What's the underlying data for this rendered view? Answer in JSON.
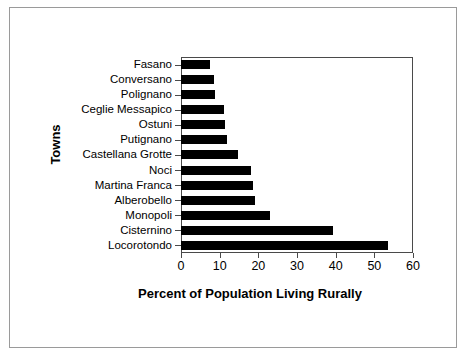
{
  "chart_data": {
    "type": "bar",
    "orientation": "horizontal",
    "title": "",
    "xlabel": "Percent of Population Living Rurally",
    "ylabel": "Towns",
    "xlim": [
      0,
      60
    ],
    "xticks": [
      0,
      10,
      20,
      30,
      40,
      50,
      60
    ],
    "grid": false,
    "legend": null,
    "bar_color": "#000000",
    "categories": [
      "Fasano",
      "Conversano",
      "Polignano",
      "Ceglie Messapico",
      "Ostuni",
      "Putignano",
      "Castellana Grotte",
      "Noci",
      "Martina Franca",
      "Alberobello",
      "Monopoli",
      "Cisternino",
      "Locorotondo"
    ],
    "values": [
      7.6,
      8.5,
      8.9,
      11.0,
      11.3,
      12.0,
      14.8,
      18.2,
      18.6,
      19.2,
      23.0,
      39.2,
      53.5
    ]
  },
  "figure": {
    "frame_color": "#9a9a9a",
    "axis_color": "#4a4a4a",
    "background": "#ffffff"
  }
}
